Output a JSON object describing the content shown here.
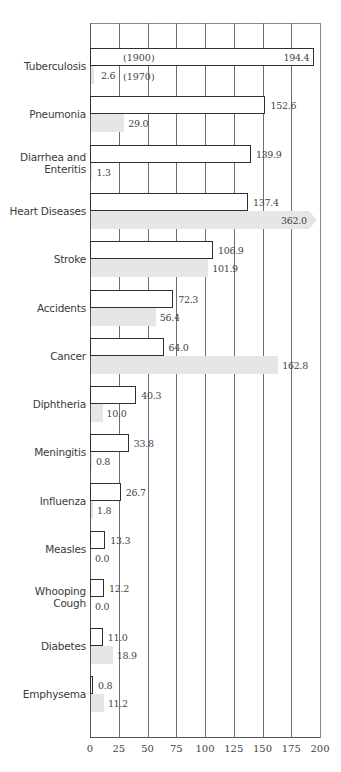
{
  "chart_data": {
    "type": "bar",
    "orientation": "horizontal",
    "title": "",
    "xlabel": "",
    "ylabel": "",
    "xlim": [
      0,
      200
    ],
    "xticks": [
      0,
      25,
      50,
      75,
      100,
      125,
      150,
      175,
      200
    ],
    "grid": true,
    "legend_position": "inline (annotations on Tuberculosis bars)",
    "categories": [
      "Tuberculosis",
      "Pneumonia",
      "Diarrhea and Enteritis",
      "Heart Diseases",
      "Stroke",
      "Accidents",
      "Cancer",
      "Diphtheria",
      "Meningitis",
      "Influenza",
      "Measles",
      "Whooping Cough",
      "Diabetes",
      "Emphysema"
    ],
    "series": [
      {
        "name": "1900",
        "style": "outlined white bar",
        "values": [
          194.4,
          152.6,
          139.9,
          137.4,
          106.9,
          72.3,
          64.0,
          40.3,
          33.8,
          26.7,
          13.3,
          12.2,
          11.0,
          0.8
        ]
      },
      {
        "name": "1970",
        "style": "light gray bar",
        "values": [
          2.6,
          29.0,
          1.3,
          362.0,
          101.9,
          56.4,
          162.8,
          10.0,
          0.8,
          1.8,
          0.0,
          0.0,
          18.9,
          11.2
        ]
      }
    ],
    "annotations": [
      "(1900)",
      "(1970)",
      "362.0 bar extends beyond axis (arrow)"
    ]
  },
  "labels": {
    "categories": [
      "Tuberculosis",
      "Pneumonia",
      "Diarrhea and",
      "Enteritis",
      "Heart Diseases",
      "Stroke",
      "Accidents",
      "Cancer",
      "Diphtheria",
      "Meningitis",
      "Influenza",
      "Measles",
      "Whooping",
      "Cough",
      "Diabetes",
      "Emphysema"
    ],
    "year1900": "(1900)",
    "year1970": "(1970)",
    "values1900": [
      "194.4",
      "152.6",
      "139.9",
      "137.4",
      "106.9",
      "72.3",
      "64.0",
      "40.3",
      "33.8",
      "26.7",
      "13.3",
      "12.2",
      "11.0",
      "0.8"
    ],
    "values1970": [
      "2.6",
      "29.0",
      "1.3",
      "362.0",
      "101.9",
      "56.4",
      "162.8",
      "10.0",
      "0.8",
      "1.8",
      "0.0",
      "0.0",
      "18.9",
      "11.2"
    ],
    "ticks": [
      "0",
      "25",
      "50",
      "75",
      "100",
      "125",
      "150",
      "175",
      "200"
    ]
  },
  "colors": {
    "bar1900_fill": "#ffffff",
    "bar1900_border": "#2f2f2f",
    "bar1970_fill": "#e6e6e6",
    "grid": "#6d6d6d",
    "text": "#3a3a3a"
  }
}
